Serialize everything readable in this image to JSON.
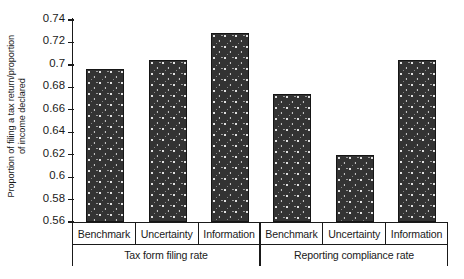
{
  "chart_data": {
    "type": "bar",
    "title": "",
    "subtitle": "",
    "xlabel": "",
    "ylabel_line1": "Proportion of filing a tax return/proportion",
    "ylabel_line2": "of income declared",
    "ylim": [
      0.56,
      0.74
    ],
    "ytick_labels": [
      "0.74",
      "0.72",
      "0.7",
      "0.68",
      "0.66",
      "0.64",
      "0.62",
      "0.6",
      "0.58",
      "0.56"
    ],
    "ytick_values": [
      0.74,
      0.72,
      0.7,
      0.68,
      0.66,
      0.64,
      0.62,
      0.6,
      0.58,
      0.56
    ],
    "grid": false,
    "legend": "none",
    "bar_color": "#333333",
    "bar_edge_color": "#161616",
    "bar_pattern": "speckled-dots",
    "categories": [
      "Benchmark",
      "Uncertainty",
      "Information",
      "Benchmark",
      "Uncertainty",
      "Information"
    ],
    "values": [
      0.696,
      0.704,
      0.728,
      0.674,
      0.62,
      0.704
    ],
    "groups": [
      {
        "label": "Tax form filing rate",
        "categories": [
          "Benchmark",
          "Uncertainty",
          "Information"
        ],
        "values": [
          0.696,
          0.704,
          0.728
        ]
      },
      {
        "label": "Reporting compliance rate",
        "categories": [
          "Benchmark",
          "Uncertainty",
          "Information"
        ],
        "values": [
          0.674,
          0.62,
          0.704
        ]
      }
    ],
    "bars": [
      {
        "group": "Tax form filing rate",
        "category": "Benchmark",
        "value": 0.696
      },
      {
        "group": "Tax form filing rate",
        "category": "Uncertainty",
        "value": 0.704
      },
      {
        "group": "Tax form filing rate",
        "category": "Information",
        "value": 0.728
      },
      {
        "group": "Reporting compliance rate",
        "category": "Benchmark",
        "value": 0.674
      },
      {
        "group": "Reporting compliance rate",
        "category": "Uncertainty",
        "value": 0.62
      },
      {
        "group": "Reporting compliance rate",
        "category": "Information",
        "value": 0.704
      }
    ]
  }
}
